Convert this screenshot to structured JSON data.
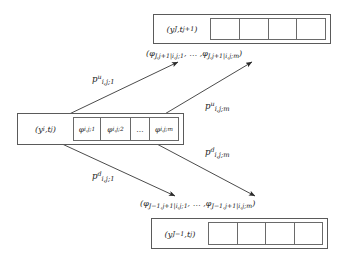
{
  "figure": {
    "type": "transition-diagram"
  },
  "nodes": {
    "top": {
      "label": "(yⱼ, tⱼ₊₁)",
      "label_text": "(yJ, tj+1)",
      "cells": [
        "",
        "",
        "",
        ""
      ],
      "cell_count": 4
    },
    "middle": {
      "label_text": "(yi, tj)",
      "cells": [
        {
          "text": "φi,j;1"
        },
        {
          "text": "φi,j;2"
        },
        {
          "text": "…"
        },
        {
          "text": "φi,j;m"
        }
      ],
      "cell_count": 4
    },
    "bottom": {
      "label_text": "(yJ−1, tj)",
      "cells": [
        "",
        "",
        "",
        ""
      ],
      "cell_count": 4
    }
  },
  "captions": {
    "top": "(φJ,j+1|i,j;1, … ,φJ,j+1|i,j;m)",
    "bottom": "(φJ−1,j+1|i,j;1, … ,φJ−1,j+1|i,j;m)"
  },
  "arrows": [
    {
      "name": "up-first",
      "label_text": "pui,j;1",
      "base": "p",
      "superscript": "u",
      "subscript": "i,j;1",
      "direction": "up",
      "from": "middle-cell-1",
      "to": "top-caption-left"
    },
    {
      "name": "up-last",
      "label_text": "pui,j;m",
      "base": "p",
      "superscript": "u",
      "subscript": "i,j;m",
      "direction": "up",
      "from": "middle-cell-m",
      "to": "top-caption-right"
    },
    {
      "name": "down-last",
      "label_text": "pdi,j;m",
      "base": "p",
      "superscript": "d",
      "subscript": "i,j;m",
      "direction": "down",
      "from": "middle-cell-m",
      "to": "bottom-caption-right"
    },
    {
      "name": "down-first",
      "label_text": "pdi,j;1",
      "base": "p",
      "superscript": "d",
      "subscript": "i,j;1",
      "direction": "down",
      "from": "middle-cell-1",
      "to": "bottom-caption-left"
    }
  ],
  "colors": {
    "stroke": "#5a5a5a",
    "cell_stroke": "#6a6a6a",
    "arrow": "#2b2b2b",
    "text": "#1a1a1a",
    "background": "#ffffff"
  }
}
